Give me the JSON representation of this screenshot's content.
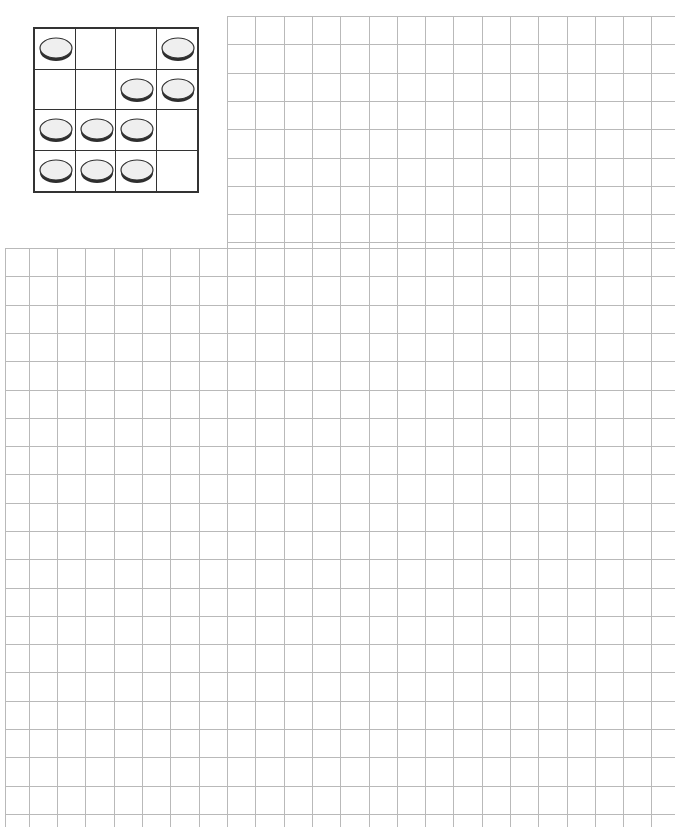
{
  "header": {
    "left_text": "",
    "right_text": ""
  },
  "puzzle": {
    "rows": 4,
    "cols": 4,
    "discs": [
      [
        1,
        0,
        0,
        1
      ],
      [
        0,
        0,
        1,
        1
      ],
      [
        1,
        1,
        1,
        0
      ],
      [
        1,
        1,
        1,
        0
      ]
    ],
    "disc_icon": "coin-disc-icon"
  },
  "grid_paper": {
    "cell_size_px": 28.3,
    "line_color": "#b9b9b9",
    "upper_region": {
      "left": 227,
      "top": 16,
      "right": 675,
      "bottom": 248
    },
    "lower_region": {
      "left": 5,
      "top": 248,
      "right": 675,
      "bottom": 827
    }
  }
}
